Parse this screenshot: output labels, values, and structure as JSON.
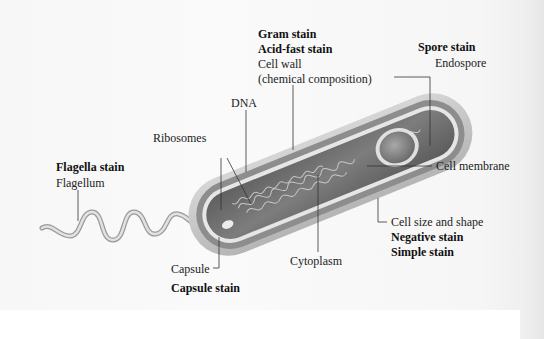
{
  "diagram": {
    "labels": {
      "gram_stain": "Gram stain",
      "acid_fast_stain": "Acid-fast stain",
      "cell_wall": "Cell wall",
      "cell_wall_note": "(chemical composition)",
      "spore_stain": "Spore stain",
      "endospore": "Endospore",
      "dna": "DNA",
      "ribosomes": "Ribosomes",
      "flagella_stain": "Flagella stain",
      "flagellum": "Flagellum",
      "cell_membrane": "Cell membrane",
      "cell_size_shape": "Cell size and shape",
      "negative_stain": "Negative stain",
      "simple_stain": "Simple stain",
      "cytoplasm": "Cytoplasm",
      "capsule": "Capsule",
      "capsule_stain": "Capsule stain"
    },
    "colors": {
      "capsule": "#c9c9c9",
      "cell_wall": "#8f8f8f",
      "membrane": "#e8e8e8",
      "cytoplasm": "#6f6f6f",
      "leader_line": "#333333"
    }
  }
}
